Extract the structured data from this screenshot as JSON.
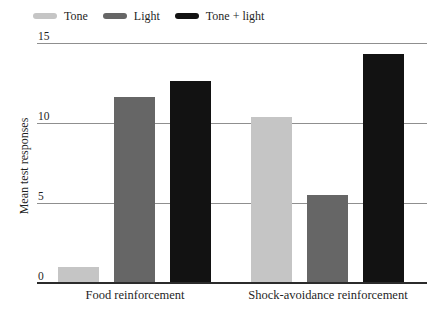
{
  "chart_data": {
    "type": "bar",
    "title": "",
    "categories": [
      "Food reinforcement",
      "Shock-avoidance reinforcement"
    ],
    "series": [
      {
        "name": "Tone",
        "color": "#c5c5c5",
        "values": [
          1.0,
          10.4
        ]
      },
      {
        "name": "Light",
        "color": "#666666",
        "values": [
          11.6,
          5.5
        ]
      },
      {
        "name": "Tone + light",
        "color": "#121212",
        "values": [
          12.6,
          14.3
        ]
      }
    ],
    "xlabel": "",
    "ylabel": "Mean test responses",
    "ylim": [
      0,
      15
    ],
    "yticks": [
      0,
      5,
      10,
      15
    ],
    "grid": true,
    "legend_position": "top-left",
    "colors": {
      "gridline": "#8f8f8f",
      "baseline": "#2b2b2b",
      "text": "#1f1f1f",
      "background": "#ffffff"
    }
  }
}
